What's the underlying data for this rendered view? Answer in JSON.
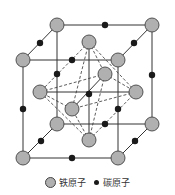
{
  "diagram": {
    "colors": {
      "iron_fill": "#b0b0b0",
      "iron_stroke": "#444444",
      "carbon_fill": "#1a1a1a",
      "line": "#333333"
    },
    "iron_atoms": [
      {
        "id": "back-top-left",
        "x": 57,
        "y": 25
      },
      {
        "id": "back-top-right",
        "x": 152,
        "y": 25
      },
      {
        "id": "front-top-left",
        "x": 23,
        "y": 60
      },
      {
        "id": "front-top-right",
        "x": 118,
        "y": 60
      },
      {
        "id": "back-bottom-left",
        "x": 57,
        "y": 124
      },
      {
        "id": "back-bottom-right",
        "x": 152,
        "y": 124
      },
      {
        "id": "front-bottom-left",
        "x": 23,
        "y": 158
      },
      {
        "id": "front-bottom-right",
        "x": 118,
        "y": 158
      },
      {
        "id": "top-face-center",
        "x": 89,
        "y": 42
      },
      {
        "id": "bottom-face-center",
        "x": 89,
        "y": 140
      },
      {
        "id": "left-face-center",
        "x": 40,
        "y": 92
      },
      {
        "id": "right-face-center",
        "x": 136,
        "y": 92
      },
      {
        "id": "back-face-center",
        "x": 105,
        "y": 74
      },
      {
        "id": "front-face-center",
        "x": 72,
        "y": 109
      }
    ],
    "carbon_atoms": [
      {
        "id": "body-center",
        "x": 89,
        "y": 94
      },
      {
        "id": "top-back-edge",
        "x": 105,
        "y": 25
      },
      {
        "id": "top-left-edge",
        "x": 40,
        "y": 43
      },
      {
        "id": "top-right-edge",
        "x": 134,
        "y": 43
      },
      {
        "id": "top-front-edge",
        "x": 72,
        "y": 60
      },
      {
        "id": "back-left-vertical",
        "x": 57,
        "y": 74
      },
      {
        "id": "back-right-vertical",
        "x": 152,
        "y": 75
      },
      {
        "id": "front-left-vertical",
        "x": 23,
        "y": 109
      },
      {
        "id": "front-right-vertical",
        "x": 118,
        "y": 109
      },
      {
        "id": "bottom-back-edge",
        "x": 105,
        "y": 124
      },
      {
        "id": "bottom-left-edge",
        "x": 41,
        "y": 141
      },
      {
        "id": "bottom-right-edge",
        "x": 135,
        "y": 141
      },
      {
        "id": "bottom-front-edge",
        "x": 72,
        "y": 158
      }
    ]
  },
  "legend": {
    "iron_label": "铁原子",
    "carbon_label": "碳原子"
  }
}
